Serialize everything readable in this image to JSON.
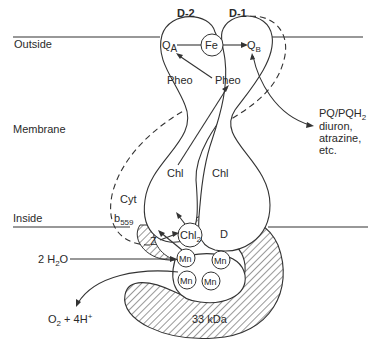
{
  "figure": {
    "regions": {
      "outside": "Outside",
      "membrane": "Membrane",
      "inside": "Inside"
    },
    "subunits": {
      "d2": "D-2",
      "d1": "D-1",
      "d": "D",
      "protein_33": "33 kDa",
      "cyt_line1": "Cyt",
      "cyt_b": "b",
      "cyt_sub": "559"
    },
    "cofactors": {
      "qa": "Q",
      "qa_sub": "A",
      "fe": "Fe",
      "qb": "Q",
      "qb_sub": "B",
      "pheo_left": "Pheo",
      "pheo_right": "Pheo",
      "chl_left": "Chl",
      "chl_right": "Chl",
      "chl2": "Chl",
      "chl2_sub": "2",
      "z": "Z",
      "mn": [
        "Mn",
        "Mn",
        "Mn",
        "Mn"
      ]
    },
    "substrates": {
      "water": "2 H",
      "water_sub": "2",
      "water_tail": "O",
      "o2": "O",
      "o2_sub": "2",
      "o2_tail": " + 4H",
      "o2_sup": "+"
    },
    "qb_site_ligands": {
      "line1_a": "PQ/PQH",
      "line1_sub": "2",
      "line2": "diuron,",
      "line3": "atrazine,",
      "line4": "etc."
    }
  }
}
